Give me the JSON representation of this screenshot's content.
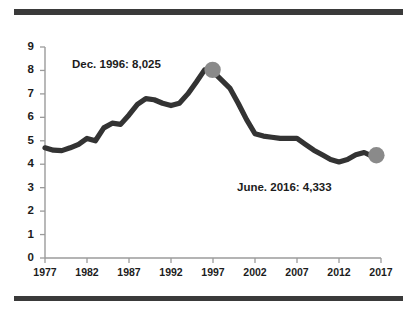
{
  "figure": {
    "top_rule": "",
    "bottom_rule": ""
  },
  "chart_data": {
    "type": "line",
    "title": "",
    "subtitle": "",
    "xlabel": "",
    "ylabel": "",
    "grid": false,
    "legend": "none",
    "xlim": [
      1977,
      2017
    ],
    "ylim": [
      0,
      9
    ],
    "yticks": [
      0,
      1,
      2,
      3,
      4,
      5,
      6,
      7,
      8,
      9
    ],
    "ytick_labels": [
      "0",
      "1",
      "2",
      "3",
      "4",
      "5",
      "6",
      "7",
      "8",
      "9"
    ],
    "xticks": [
      1977,
      1982,
      1987,
      1992,
      1997,
      2002,
      2007,
      2012,
      2017
    ],
    "xtick_labels": [
      "1977",
      "1982",
      "1987",
      "1992",
      "1997",
      "2002",
      "2007",
      "2012",
      "2017"
    ],
    "line_color": "#333333",
    "marker_color": "#8a8a8a",
    "series": [
      {
        "name": "series-1",
        "x": [
          1977,
          1978,
          1979,
          1980,
          1981,
          1982,
          1983,
          1984,
          1985,
          1986,
          1987,
          1988,
          1989,
          1990,
          1991,
          1992,
          1993,
          1994,
          1995,
          1996,
          1997,
          1998,
          1999,
          2000,
          2001,
          2002,
          2003,
          2004,
          2005,
          2006,
          2007,
          2008,
          2009,
          2010,
          2011,
          2012,
          2013,
          2014,
          2015,
          2016
        ],
        "values": [
          4.7,
          4.6,
          4.58,
          4.7,
          4.85,
          5.1,
          5.0,
          5.55,
          5.75,
          5.7,
          6.1,
          6.55,
          6.8,
          6.75,
          6.6,
          6.5,
          6.6,
          7.0,
          7.5,
          8.025,
          7.95,
          7.6,
          7.25,
          6.6,
          5.9,
          5.3,
          5.2,
          5.15,
          5.1,
          5.1,
          5.1,
          4.85,
          4.6,
          4.4,
          4.2,
          4.1,
          4.2,
          4.4,
          4.5,
          4.333
        ]
      }
    ],
    "markers": [
      {
        "name": "peak-marker",
        "x": 1996.95,
        "y": 8.025
      },
      {
        "name": "end-marker",
        "x": 2016.45,
        "y": 4.38
      }
    ],
    "annotations": [
      {
        "name": "annotation-peak",
        "text": "Dec. 1996: 8,025",
        "x": 1996,
        "y": 8.025
      },
      {
        "name": "annotation-end",
        "text": "June. 2016: 4,333",
        "x": 2016,
        "y": 4.333
      }
    ]
  }
}
